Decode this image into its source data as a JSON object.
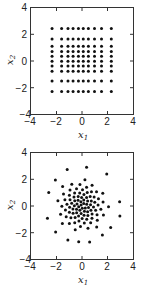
{
  "chart_data": [
    {
      "type": "scatter",
      "title": "",
      "xlabel": "x1",
      "ylabel": "x2",
      "xlim": [
        -4,
        4
      ],
      "ylim": [
        -4,
        4
      ],
      "xticks": [
        -4,
        -2,
        0,
        2,
        4
      ],
      "yticks": [
        -4,
        -2,
        0,
        2,
        4
      ],
      "grid": false,
      "description": "10x10 grid of points with Gaussian-quantile spacing",
      "grid_x": [
        -2.35,
        -1.6,
        -1.1,
        -0.7,
        -0.28,
        0.1,
        0.5,
        0.98,
        1.53,
        2.3
      ],
      "grid_y": [
        2.45,
        1.66,
        1.12,
        0.72,
        0.35,
        -0.02,
        -0.37,
        -0.77,
        -1.51,
        -2.31
      ]
    },
    {
      "type": "scatter",
      "title": "",
      "xlabel": "x1",
      "ylabel": "x2",
      "xlim": [
        -4,
        4
      ],
      "ylim": [
        -4,
        4
      ],
      "xticks": [
        -4,
        -2,
        0,
        2,
        4
      ],
      "yticks": [
        -4,
        -2,
        0,
        2,
        4
      ],
      "grid": false,
      "description": "~100 points in a spiral (sunflower) pattern approximating a 2D Gaussian",
      "points": [
        [
          -0.07,
          0.07
        ],
        [
          0.02,
          -0.17
        ],
        [
          0.14,
          0.18
        ],
        [
          -0.26,
          -0.05
        ],
        [
          0.26,
          -0.16
        ],
        [
          -0.09,
          0.32
        ],
        [
          -0.17,
          -0.33
        ],
        [
          0.37,
          0.14
        ],
        [
          -0.39,
          0.16
        ],
        [
          0.19,
          -0.4
        ],
        [
          0.14,
          0.45
        ],
        [
          -0.43,
          -0.25
        ],
        [
          0.51,
          -0.11
        ],
        [
          -0.31,
          0.44
        ],
        [
          -0.07,
          -0.56
        ],
        [
          0.44,
          0.37
        ],
        [
          -0.6,
          0.02
        ],
        [
          0.44,
          -0.44
        ],
        [
          -0.03,
          0.64
        ],
        [
          -0.42,
          -0.51
        ],
        [
          0.67,
          0.09
        ],
        [
          -0.57,
          0.4
        ],
        [
          0.16,
          -0.7
        ],
        [
          0.36,
          0.64
        ],
        [
          -0.71,
          -0.23
        ],
        [
          0.7,
          -0.32
        ],
        [
          -0.3,
          0.72
        ],
        [
          -0.27,
          -0.76
        ],
        [
          0.73,
          0.38
        ],
        [
          -0.81,
          0.21
        ],
        [
          0.46,
          -0.72
        ],
        [
          0.15,
          0.86
        ],
        [
          -0.7,
          -0.54
        ],
        [
          0.9,
          -0.07
        ],
        [
          -0.63,
          0.68
        ],
        [
          0.01,
          -0.94
        ],
        [
          0.64,
          0.71
        ],
        [
          -0.97,
          -0.09
        ],
        [
          0.79,
          -0.6
        ],
        [
          -0.18,
          0.99
        ],
        [
          -0.54,
          -0.86
        ],
        [
          1.0,
          0.28
        ],
        [
          -0.94,
          0.48
        ],
        [
          0.37,
          -1.0
        ],
        [
          0.41,
          1.01
        ],
        [
          -0.99,
          -0.48
        ],
        [
          1.07,
          -0.33
        ],
        [
          -0.58,
          0.98
        ],
        [
          -0.24,
          -1.13
        ],
        [
          0.95,
          0.68
        ],
        [
          -1.18,
          0.14
        ],
        [
          0.78,
          -0.92
        ],
        [
          0.04,
          1.22
        ],
        [
          -0.87,
          -0.89
        ],
        [
          1.26,
          0.07
        ],
        [
          -0.99,
          0.81
        ],
        [
          0.18,
          -1.28
        ],
        [
          0.74,
          1.08
        ],
        [
          -1.3,
          -0.3
        ],
        [
          1.18,
          -0.66
        ],
        [
          -0.43,
          1.3
        ],
        [
          -0.57,
          -1.26
        ],
        [
          1.29,
          0.55
        ],
        [
          -1.34,
          0.47
        ],
        [
          0.68,
          -1.27
        ],
        [
          0.36,
          1.41
        ],
        [
          -1.24,
          -0.81
        ],
        [
          1.48,
          -0.24
        ],
        [
          -0.94,
          1.2
        ],
        [
          -0.12,
          -1.54
        ],
        [
          1.14,
          1.07
        ],
        [
          -1.58,
          -0.02
        ],
        [
          1.2,
          -1.07
        ],
        [
          -0.16,
          1.62
        ],
        [
          -0.99,
          -1.33
        ],
        [
          1.65,
          0.31
        ],
        [
          -1.45,
          0.9
        ],
        [
          0.47,
          -1.67
        ],
        [
          0.79,
          1.57
        ],
        [
          -1.68,
          -0.63
        ],
        [
          1.68,
          -0.67
        ],
        [
          -0.8,
          1.65
        ],
        [
          -0.53,
          -1.79
        ],
        [
          1.63,
          0.97
        ],
        [
          -1.89,
          0.39
        ],
        [
          1.15,
          -1.59
        ],
        [
          0.23,
          1.99
        ],
        [
          -1.54,
          -1.33
        ],
        [
          2.08,
          -0.06
        ],
        [
          -1.52,
          1.48
        ],
        [
          0.36,
          2.93
        ],
        [
          -1.16,
          2.76
        ],
        [
          1.94,
          2.41
        ],
        [
          -2.09,
          1.96
        ],
        [
          2.95,
          0.32
        ],
        [
          -2.61,
          1.02
        ],
        [
          2.97,
          -0.75
        ],
        [
          -2.71,
          -0.92
        ],
        [
          -2.07,
          -1.96
        ],
        [
          -1.11,
          -2.56
        ],
        [
          -0.26,
          -2.69
        ],
        [
          0.6,
          -2.71
        ],
        [
          1.6,
          -2.19
        ],
        [
          2.25,
          -1.62
        ]
      ]
    }
  ],
  "panels": [
    {
      "xlabel_main": "x",
      "xlabel_sub": "1",
      "ylabel_main": "x",
      "ylabel_sub": "2",
      "xtick_labels": [
        "−4",
        "−2",
        "0",
        "2",
        "4"
      ],
      "ytick_labels": [
        "4",
        "2",
        "0",
        "−2",
        "−4"
      ]
    },
    {
      "xlabel_main": "x",
      "xlabel_sub": "1",
      "ylabel_main": "x",
      "ylabel_sub": "2",
      "xtick_labels": [
        "−4",
        "−2",
        "0",
        "2",
        "4"
      ],
      "ytick_labels": [
        "4",
        "2",
        "0",
        "−2",
        "−4"
      ]
    }
  ],
  "colors": {
    "marker": "#111111",
    "axis": "#333333",
    "background": "#ffffff"
  }
}
